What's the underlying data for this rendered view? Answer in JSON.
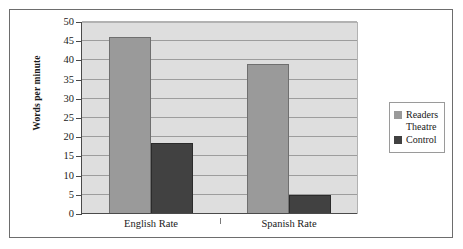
{
  "chart_data": {
    "type": "bar",
    "title": "",
    "subtitle": "",
    "xlabel": "",
    "ylabel": "Words per minute",
    "categories": [
      "English Rate",
      "Spanish Rate"
    ],
    "series": [
      {
        "name": "Readers Theatre",
        "values": [
          46,
          39
        ],
        "color": "#9a9a9a"
      },
      {
        "name": "Control",
        "values": [
          18.5,
          5
        ],
        "color": "#414141"
      }
    ],
    "ylim": [
      0,
      50
    ],
    "ytick_step": 5,
    "yticks": [
      0,
      5,
      10,
      15,
      20,
      25,
      30,
      35,
      40,
      45,
      50
    ],
    "ytick_labels": [
      "0",
      "5",
      "10",
      "15",
      "20",
      "25",
      "30",
      "35",
      "40",
      "45",
      "50"
    ],
    "grid": true,
    "grid_axis": "y",
    "legend_position": "right",
    "legend_entries": [
      "Readers Theatre",
      "Control"
    ],
    "plot_background": "#dedede",
    "figure_background": "#ffffff",
    "border_color": "#6d6d6d"
  },
  "legend": {
    "entries": [
      {
        "label": "Readers\nTheatre",
        "swatch": "#9a9a9a"
      },
      {
        "label": "Control",
        "swatch": "#414141"
      }
    ]
  },
  "axes": {
    "y_title": "Words per minute"
  }
}
